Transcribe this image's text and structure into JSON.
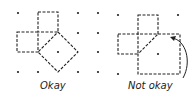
{
  "panels": [
    {
      "label": "Okay",
      "label_x": 40,
      "label_y": 82
    },
    {
      "label": "Not okay",
      "label_x": 128,
      "label_y": 82
    }
  ],
  "colors": {
    "ink": "#222222"
  }
}
